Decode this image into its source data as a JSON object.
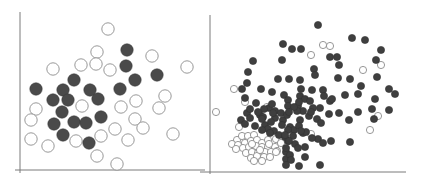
{
  "chart_data": [
    {
      "type": "scatter",
      "title": "",
      "xlabel": "",
      "ylabel": "",
      "grid": false,
      "legend": null,
      "frame": {
        "x_axis_px": [
          15,
          205,
          170
        ],
        "y_axis_px": [
          20,
          12,
          173
        ]
      },
      "marker_radius": 6.2,
      "series": [
        {
          "name": "filled",
          "fill": "#4a4a4a",
          "stroke": "#3a3a3a",
          "points": [
            [
              127,
              50
            ],
            [
              126,
              66
            ],
            [
              135,
              80
            ],
            [
              157,
              75
            ],
            [
              74,
              80
            ],
            [
              36,
              89
            ],
            [
              63,
              90
            ],
            [
              90,
              90
            ],
            [
              120,
              89
            ],
            [
              53,
              100
            ],
            [
              68,
              100
            ],
            [
              98,
              99
            ],
            [
              62,
              112
            ],
            [
              101,
              117
            ],
            [
              54,
              124
            ],
            [
              74,
              122
            ],
            [
              86,
              123
            ],
            [
              63,
              135
            ],
            [
              89,
              143
            ]
          ]
        },
        {
          "name": "hollow",
          "fill": "#ffffff",
          "stroke": "#8c8c8c",
          "points": [
            [
              108,
              29
            ],
            [
              97,
              52
            ],
            [
              152,
              56
            ],
            [
              53,
              69
            ],
            [
              81,
              65
            ],
            [
              96,
              64
            ],
            [
              110,
              70
            ],
            [
              187,
              67
            ],
            [
              165,
              96
            ],
            [
              36,
              109
            ],
            [
              82,
              106
            ],
            [
              136,
              101
            ],
            [
              121,
              107
            ],
            [
              159,
              108
            ],
            [
              31,
              120
            ],
            [
              135,
              119
            ],
            [
              115,
              129
            ],
            [
              143,
              128
            ],
            [
              101,
              136
            ],
            [
              31,
              139
            ],
            [
              48,
              146
            ],
            [
              76,
              141
            ],
            [
              128,
              140
            ],
            [
              173,
              134
            ],
            [
              97,
              156
            ],
            [
              117,
              164
            ]
          ]
        }
      ]
    },
    {
      "type": "scatter",
      "title": "",
      "xlabel": "",
      "ylabel": "",
      "grid": false,
      "legend": null,
      "frame": {
        "x_axis_px": [
          200,
          406,
          172
        ],
        "y_axis_px": [
          210,
          15,
          174
        ]
      },
      "marker_radius": 3.6,
      "series": [
        {
          "name": "filled",
          "fill": "#3f3f3f",
          "stroke": "#333333",
          "points": [
            [
              318,
              25
            ],
            [
              352,
              38
            ],
            [
              365,
              40
            ],
            [
              283,
              44
            ],
            [
              292,
              49
            ],
            [
              301,
              49
            ],
            [
              381,
              50
            ],
            [
              330,
              57
            ],
            [
              337,
              57
            ],
            [
              253,
              61
            ],
            [
              282,
              60
            ],
            [
              376,
              60
            ],
            [
              339,
              65
            ],
            [
              248,
              72
            ],
            [
              314,
              69
            ],
            [
              315,
              75
            ],
            [
              247,
              83
            ],
            [
              289,
              79
            ],
            [
              300,
              80
            ],
            [
              338,
              78
            ],
            [
              350,
              79
            ],
            [
              377,
              77
            ],
            [
              242,
              89
            ],
            [
              278,
              79
            ],
            [
              261,
              89
            ],
            [
              301,
              89
            ],
            [
              361,
              86
            ],
            [
              284,
              95
            ],
            [
              300,
              96
            ],
            [
              312,
              90
            ],
            [
              323,
              90
            ],
            [
              324,
              96
            ],
            [
              305,
              99
            ],
            [
              288,
              100
            ],
            [
              272,
              92
            ],
            [
              310,
              101
            ],
            [
              330,
              101
            ],
            [
              313,
              108
            ],
            [
              245,
              98
            ],
            [
              269,
              108
            ],
            [
              332,
              99
            ],
            [
              345,
              95
            ],
            [
              358,
              94
            ],
            [
              375,
              99
            ],
            [
              389,
              89
            ],
            [
              395,
              94
            ],
            [
              256,
              103
            ],
            [
              288,
              106
            ],
            [
              264,
              109
            ],
            [
              260,
              115
            ],
            [
              275,
              111
            ],
            [
              281,
              113
            ],
            [
              298,
              106
            ],
            [
              303,
              111
            ],
            [
              309,
              116
            ],
            [
              317,
              119
            ],
            [
              247,
              113
            ],
            [
              329,
              114
            ],
            [
              339,
              113
            ],
            [
              320,
              108
            ],
            [
              389,
              110
            ],
            [
              372,
              109
            ],
            [
              241,
              120
            ],
            [
              250,
              118
            ],
            [
              263,
              117
            ],
            [
              265,
              125
            ],
            [
              275,
              118
            ],
            [
              283,
              120
            ],
            [
              287,
              115
            ],
            [
              300,
              120
            ],
            [
              245,
              124
            ],
            [
              255,
              126
            ],
            [
              268,
              129
            ],
            [
              274,
              131
            ],
            [
              290,
              127
            ],
            [
              294,
              130
            ],
            [
              299,
              126
            ],
            [
              297,
              111
            ],
            [
              262,
              130
            ],
            [
              270,
              133
            ],
            [
              279,
              135
            ],
            [
              285,
              137
            ],
            [
              293,
              136
            ],
            [
              303,
              133
            ],
            [
              306,
              132
            ],
            [
              321,
              123
            ],
            [
              349,
              120
            ],
            [
              358,
              112
            ],
            [
              374,
              119
            ],
            [
              262,
              119
            ],
            [
              271,
              122
            ],
            [
              288,
              141
            ],
            [
              301,
              131
            ],
            [
              318,
              139
            ],
            [
              312,
              138
            ],
            [
              295,
              144
            ],
            [
              298,
              148
            ],
            [
              286,
              152
            ],
            [
              289,
              141
            ],
            [
              305,
              147
            ],
            [
              323,
              143
            ],
            [
              331,
              141
            ],
            [
              350,
              142
            ],
            [
              305,
              157
            ],
            [
              286,
              159
            ],
            [
              286,
              148
            ],
            [
              290,
              155
            ],
            [
              291,
              160
            ],
            [
              286,
              165
            ],
            [
              320,
              165
            ],
            [
              299,
              166
            ],
            [
              272,
              104
            ],
            [
              294,
              107
            ],
            [
              299,
              102
            ],
            [
              311,
              112
            ],
            [
              273,
              113
            ],
            [
              282,
              125
            ],
            [
              288,
              130
            ],
            [
              250,
              109
            ],
            [
              258,
              112
            ],
            [
              289,
              112
            ],
            [
              285,
              135
            ]
          ],
          "note": "approx. 120 filled points in the upper/central cloud"
        },
        {
          "name": "hollow",
          "fill": "#ffffff",
          "stroke": "#8c8c8c",
          "points": [
            [
              323,
              45
            ],
            [
              330,
              46
            ],
            [
              311,
              55
            ],
            [
              363,
              70
            ],
            [
              381,
              65
            ],
            [
              234,
              89
            ],
            [
              245,
              102
            ],
            [
              267,
              107
            ],
            [
              216,
              112
            ],
            [
              239,
              127
            ],
            [
              378,
              116
            ],
            [
              370,
              130
            ],
            [
              311,
              134
            ],
            [
              237,
              140
            ],
            [
              242,
              136
            ],
            [
              248,
              136
            ],
            [
              254,
              135
            ],
            [
              232,
              144
            ],
            [
              238,
              145
            ],
            [
              245,
              143
            ],
            [
              251,
              141
            ],
            [
              257,
              140
            ],
            [
              262,
              143
            ],
            [
              268,
              140
            ],
            [
              276,
              139
            ],
            [
              282,
              141
            ],
            [
              236,
              149
            ],
            [
              243,
              148
            ],
            [
              249,
              147
            ],
            [
              256,
              146
            ],
            [
              262,
              147
            ],
            [
              268,
              147
            ],
            [
              275,
              147
            ],
            [
              281,
              143
            ],
            [
              246,
              153
            ],
            [
              252,
              152
            ],
            [
              258,
              153
            ],
            [
              265,
              152
            ],
            [
              271,
              152
            ],
            [
              277,
              151
            ],
            [
              251,
              158
            ],
            [
              257,
              156
            ],
            [
              264,
              157
            ],
            [
              270,
              157
            ],
            [
              254,
              161
            ],
            [
              262,
              161
            ],
            [
              252,
              144
            ],
            [
              269,
              144
            ],
            [
              276,
              152
            ],
            [
              260,
              150
            ]
          ],
          "note": "hollow points concentrated in lower-left cluster plus scattered outliers"
        }
      ]
    }
  ],
  "charts": {
    "left": {
      "label": "Scatter plot with two classes (filled vs hollow), large markers"
    },
    "right": {
      "label": "Scatter plot with two classes (filled vs hollow), small markers, dense overlap"
    }
  },
  "colors": {
    "axis": "#7a7a7a",
    "filled_left": "#4a4a4a",
    "filled_right": "#3f3f3f",
    "hollow_stroke": "#8c8c8c",
    "background": "#ffffff"
  }
}
